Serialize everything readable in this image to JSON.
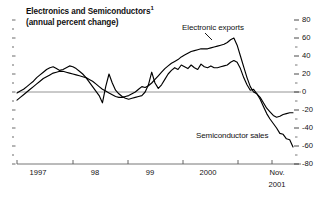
{
  "chart_data": {
    "type": "line",
    "title": "Electronics and Semiconductors",
    "title_superscript": "1",
    "subtitle": "(annual percent change)",
    "xlabel": "",
    "ylabel": "",
    "ylim": [
      -80,
      80
    ],
    "y_ticks": [
      80,
      60,
      40,
      20,
      0,
      -20,
      -40,
      -60,
      -80
    ],
    "y_tick_labels": [
      "80",
      "60",
      "40",
      "20",
      "0",
      "-20",
      "-40",
      "-60",
      "-80"
    ],
    "y_axis_position": "right",
    "grid": false,
    "zero_line": true,
    "x_tick_labels": [
      "1997",
      "98",
      "99",
      "2000",
      "Nov.",
      "2001"
    ],
    "x_tick_positions": [
      17,
      73,
      128,
      183,
      272,
      272
    ],
    "legend_position": "inline-annotation",
    "x_start": "1996-07",
    "x_end": "2001-11",
    "series": [
      {
        "name": "Electronic exports",
        "color": "#000000",
        "values": [
          -9,
          -6,
          -3,
          0,
          3,
          6,
          9,
          12,
          15,
          17,
          19,
          21,
          22,
          23,
          23,
          22,
          21,
          20,
          19,
          18,
          17,
          16,
          14,
          12,
          9,
          6,
          3,
          1,
          -1,
          -3,
          -5,
          -6,
          -6,
          -5,
          -4,
          -2,
          0,
          3,
          6,
          5,
          7,
          10,
          14,
          18,
          22,
          26,
          29,
          32,
          34,
          36,
          39,
          41,
          43,
          45,
          46,
          47,
          48,
          48,
          48,
          49,
          50,
          51,
          52,
          53,
          55,
          58,
          60,
          52,
          40,
          28,
          16,
          6,
          0,
          -2,
          -6,
          -12,
          -18,
          -22,
          -26,
          -28,
          -27,
          -25,
          -24,
          -23,
          -23
        ]
      },
      {
        "name": "Semiconductor sales",
        "color": "#000000",
        "values": [
          -1,
          1,
          3,
          6,
          9,
          12,
          16,
          19,
          22,
          25,
          27,
          28,
          26,
          24,
          25,
          27,
          29,
          28,
          26,
          23,
          20,
          16,
          11,
          6,
          1,
          -4,
          -12,
          6,
          20,
          10,
          2,
          -2,
          -5,
          -7,
          -8,
          -7,
          -6,
          -5,
          -4,
          0,
          8,
          22,
          10,
          4,
          8,
          14,
          20,
          24,
          27,
          25,
          30,
          28,
          26,
          30,
          27,
          25,
          31,
          28,
          27,
          29,
          27,
          27,
          28,
          29,
          30,
          33,
          35,
          33,
          26,
          16,
          8,
          2,
          3,
          -2,
          -8,
          -16,
          -24,
          -30,
          -35,
          -40,
          -46,
          -47,
          -52,
          -53,
          -61
        ]
      }
    ]
  }
}
